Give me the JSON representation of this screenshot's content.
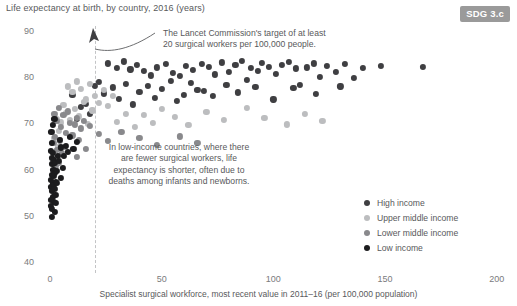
{
  "header": {
    "y_axis_title": "Life expectancy at birth, by country, 2016 (years)",
    "badge": "SDG 3.c"
  },
  "annotations": {
    "target_note_line1": "The Lancet Commission's target of at least",
    "target_note_line2": "20 surgical workers per 100,000 people.",
    "low_income_note": "In low-income countries, where there are fewer surgical workers, life expectancy is shorter, often due to deaths among infants and newborns.",
    "arrow_icon": "curved-arrow-icon",
    "threshold_value": 20
  },
  "legend": {
    "position": "bottom-right",
    "items": [
      {
        "label": "High income",
        "color": "#3f3f42"
      },
      {
        "label": "Upper middle income",
        "color": "#bcbdbf"
      },
      {
        "label": "Lower middle income",
        "color": "#89898c"
      },
      {
        "label": "Low income",
        "color": "#1c1c1e"
      }
    ]
  },
  "chart_data": {
    "type": "scatter",
    "title": "",
    "xlabel": "Specialist surgical workforce, most recent value in 2011–16 (per 100,000 population)",
    "ylabel": "Life expectancy at birth, by country, 2016 (years)",
    "xlim": [
      0,
      200
    ],
    "ylim": [
      40,
      90
    ],
    "xticks": [
      0,
      50,
      100,
      150,
      200
    ],
    "yticks": [
      40,
      50,
      60,
      70,
      80,
      90
    ],
    "grid": false,
    "threshold_line": {
      "x": 20,
      "style": "dashed",
      "color": "#c3c4c6"
    },
    "series": [
      {
        "name": "High income",
        "color": "#3f3f42",
        "points": [
          [
            26,
            83.0
          ],
          [
            30,
            82.0
          ],
          [
            33,
            83.4
          ],
          [
            36,
            81.7
          ],
          [
            39,
            82.6
          ],
          [
            42,
            81.3
          ],
          [
            45,
            80.4
          ],
          [
            48,
            82.1
          ],
          [
            52,
            82.8
          ],
          [
            55,
            81.0
          ],
          [
            58,
            80.2
          ],
          [
            61,
            82.4
          ],
          [
            64,
            81.5
          ],
          [
            66,
            77.2
          ],
          [
            68,
            82.9
          ],
          [
            71,
            82.2
          ],
          [
            74,
            80.6
          ],
          [
            77,
            83.2
          ],
          [
            80,
            81.1
          ],
          [
            83,
            82.7
          ],
          [
            86,
            83.5
          ],
          [
            88,
            79.4
          ],
          [
            90,
            82.0
          ],
          [
            93,
            81.4
          ],
          [
            95,
            83.1
          ],
          [
            98,
            82.3
          ],
          [
            101,
            80.8
          ],
          [
            104,
            82.6
          ],
          [
            107,
            83.3
          ],
          [
            110,
            81.9
          ],
          [
            112,
            78.3
          ],
          [
            115,
            82.1
          ],
          [
            118,
            83.0
          ],
          [
            121,
            80.1
          ],
          [
            124,
            82.5
          ],
          [
            128,
            81.2
          ],
          [
            132,
            82.8
          ],
          [
            136,
            79.8
          ],
          [
            140,
            82.0
          ],
          [
            148,
            82.4
          ],
          [
            167,
            82.3
          ],
          [
            22,
            79.0
          ],
          [
            24,
            76.5
          ],
          [
            28,
            77.8
          ],
          [
            31,
            75.3
          ],
          [
            34,
            78.6
          ],
          [
            37,
            74.1
          ],
          [
            40,
            76.9
          ],
          [
            44,
            78.1
          ],
          [
            47,
            75.6
          ],
          [
            50,
            77.4
          ],
          [
            54,
            79.2
          ],
          [
            57,
            74.8
          ],
          [
            60,
            76.2
          ],
          [
            63,
            78.8
          ],
          [
            69,
            77.1
          ],
          [
            73,
            75.9
          ],
          [
            79,
            78.4
          ],
          [
            84,
            76.7
          ],
          [
            92,
            77.9
          ],
          [
            100,
            75.2
          ],
          [
            109,
            77.6
          ],
          [
            119,
            76.4
          ],
          [
            130,
            78.0
          ],
          [
            16,
            74.2
          ],
          [
            18,
            72.0
          ],
          [
            20,
            78.2
          ],
          [
            12,
            70.9
          ],
          [
            14,
            73.6
          ],
          [
            10,
            76.1
          ]
        ]
      },
      {
        "name": "Upper middle income",
        "color": "#bcbdbf",
        "points": [
          [
            8,
            78.0
          ],
          [
            10,
            76.8
          ],
          [
            12,
            79.1
          ],
          [
            14,
            77.4
          ],
          [
            16,
            75.2
          ],
          [
            18,
            78.6
          ],
          [
            20,
            76.0
          ],
          [
            22,
            74.5
          ],
          [
            24,
            77.2
          ],
          [
            26,
            73.8
          ],
          [
            28,
            75.9
          ],
          [
            6,
            74.0
          ],
          [
            7,
            72.3
          ],
          [
            9,
            70.8
          ],
          [
            11,
            73.1
          ],
          [
            13,
            71.5
          ],
          [
            15,
            74.7
          ],
          [
            17,
            69.9
          ],
          [
            19,
            72.8
          ],
          [
            5,
            70.2
          ],
          [
            4,
            68.4
          ],
          [
            3,
            71.0
          ],
          [
            2,
            66.8
          ],
          [
            30,
            70.4
          ],
          [
            34,
            72.1
          ],
          [
            38,
            69.2
          ],
          [
            42,
            71.8
          ],
          [
            46,
            70.1
          ],
          [
            50,
            73.2
          ],
          [
            56,
            71.4
          ],
          [
            62,
            69.6
          ],
          [
            70,
            72.5
          ],
          [
            78,
            70.8
          ],
          [
            88,
            73.4
          ],
          [
            96,
            71.2
          ],
          [
            106,
            69.8
          ],
          [
            114,
            72.0
          ],
          [
            122,
            70.6
          ],
          [
            2.5,
            63.2
          ],
          [
            3.5,
            64.9
          ]
        ]
      },
      {
        "name": "Lower middle income",
        "color": "#89898c",
        "points": [
          [
            2,
            72.0
          ],
          [
            3,
            70.5
          ],
          [
            4,
            73.4
          ],
          [
            5,
            69.2
          ],
          [
            6,
            71.8
          ],
          [
            7,
            68.0
          ],
          [
            8,
            72.6
          ],
          [
            9,
            70.1
          ],
          [
            10,
            67.4
          ],
          [
            11,
            69.8
          ],
          [
            12,
            71.2
          ],
          [
            13,
            66.5
          ],
          [
            14,
            68.9
          ],
          [
            15,
            70.6
          ],
          [
            1.5,
            65.8
          ],
          [
            2.2,
            67.1
          ],
          [
            3.2,
            64.2
          ],
          [
            4.5,
            66.3
          ],
          [
            5.5,
            63.5
          ],
          [
            6.5,
            65.0
          ],
          [
            1.2,
            62.0
          ],
          [
            2.8,
            60.8
          ],
          [
            1.8,
            59.4
          ],
          [
            3.8,
            61.5
          ],
          [
            18,
            69.4
          ],
          [
            22,
            67.8
          ],
          [
            26,
            66.2
          ],
          [
            32,
            68.1
          ],
          [
            40,
            66.9
          ],
          [
            48,
            65.4
          ],
          [
            58,
            67.2
          ],
          [
            66,
            65.8
          ],
          [
            12,
            62.8
          ],
          [
            16,
            64.4
          ]
        ]
      },
      {
        "name": "Low income",
        "color": "#1c1c1e",
        "points": [
          [
            0.5,
            64.0
          ],
          [
            0.7,
            62.5
          ],
          [
            0.9,
            65.8
          ],
          [
            1.1,
            61.2
          ],
          [
            1.3,
            63.6
          ],
          [
            1.5,
            60.0
          ],
          [
            1.7,
            62.1
          ],
          [
            1.9,
            58.6
          ],
          [
            2.1,
            61.4
          ],
          [
            2.3,
            59.2
          ],
          [
            0.4,
            57.8
          ],
          [
            0.6,
            56.2
          ],
          [
            0.8,
            58.9
          ],
          [
            1.0,
            55.4
          ],
          [
            1.2,
            57.0
          ],
          [
            1.4,
            54.1
          ],
          [
            1.6,
            56.6
          ],
          [
            1.8,
            53.0
          ],
          [
            2.0,
            55.8
          ],
          [
            2.4,
            54.6
          ],
          [
            2.6,
            57.4
          ],
          [
            0.3,
            53.5
          ],
          [
            0.5,
            52.2
          ],
          [
            2.8,
            52.8
          ],
          [
            3.0,
            59.8
          ],
          [
            3.4,
            63.0
          ],
          [
            4.0,
            61.8
          ],
          [
            4.4,
            66.4
          ],
          [
            5.0,
            64.8
          ],
          [
            5.6,
            60.4
          ],
          [
            6.2,
            62.9
          ],
          [
            7.0,
            65.2
          ],
          [
            8.0,
            63.8
          ],
          [
            9.0,
            67.0
          ],
          [
            10.5,
            64.5
          ],
          [
            12.0,
            66.0
          ],
          [
            2.2,
            50.8
          ],
          [
            1.0,
            51.5
          ],
          [
            0.8,
            49.8
          ],
          [
            3.2,
            57.2
          ],
          [
            0.6,
            68.2
          ],
          [
            1.4,
            69.6
          ],
          [
            2.0,
            71.0
          ],
          [
            4.8,
            58.2
          ]
        ]
      }
    ]
  }
}
